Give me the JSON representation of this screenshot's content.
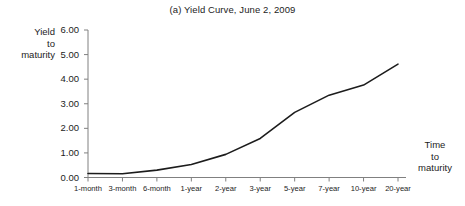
{
  "chart_data": {
    "type": "line",
    "title": "(a) Yield Curve, June 2, 2009",
    "xlabel": "Time to maturity",
    "ylabel": "Yield to maturity",
    "categories": [
      "1-month",
      "3-month",
      "6-month",
      "1-year",
      "2-year",
      "3-year",
      "5-year",
      "7-year",
      "10-year",
      "20-year"
    ],
    "values": [
      0.16,
      0.15,
      0.3,
      0.53,
      0.94,
      1.59,
      2.65,
      3.35,
      3.76,
      4.61
    ],
    "series": [
      {
        "name": "Yield curve",
        "values": [
          0.16,
          0.15,
          0.3,
          0.53,
          0.94,
          1.59,
          2.65,
          3.35,
          3.76,
          4.61
        ]
      }
    ],
    "ylim": [
      0.0,
      6.0
    ],
    "ytick_labels": [
      "0.00",
      "1.00",
      "2.00",
      "3.00",
      "4.00",
      "5.00",
      "6.00"
    ],
    "ytick_values": [
      0.0,
      1.0,
      2.0,
      3.0,
      4.0,
      5.0,
      6.0
    ],
    "grid": false,
    "legend": "none",
    "line_color": "#1c1c1c",
    "axis_color": "#808080"
  },
  "figure": {
    "title": "(a) Yield Curve, June 2, 2009",
    "y_caption_lines": [
      "Yield",
      "to",
      "maturity"
    ],
    "x_caption_lines": [
      "Time",
      "to",
      "maturity"
    ]
  }
}
